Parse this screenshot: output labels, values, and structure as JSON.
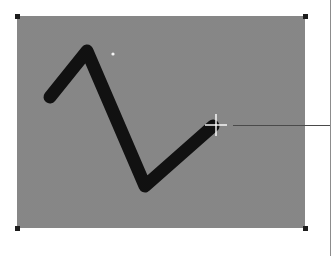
{
  "canvas": {
    "background_color": "#8a8a8a",
    "bounds": {
      "left": 17,
      "top": 16,
      "right": 305,
      "bottom": 228
    }
  },
  "selection_handles": [
    {
      "position": "top-left",
      "x": 17,
      "y": 16
    },
    {
      "position": "top-right",
      "x": 305,
      "y": 16
    },
    {
      "position": "bottom-left",
      "x": 17,
      "y": 228
    },
    {
      "position": "bottom-right",
      "x": 305,
      "y": 228
    }
  ],
  "stroke": {
    "color": "#111111",
    "width": 13,
    "points": [
      [
        50,
        97
      ],
      [
        87,
        51
      ],
      [
        145,
        186
      ],
      [
        213,
        126
      ]
    ]
  },
  "cursor": {
    "icon": "crosshair-icon",
    "x": 216,
    "y": 125
  },
  "guide_line": {
    "from_x": 233,
    "to_x": 331,
    "y": 125
  }
}
